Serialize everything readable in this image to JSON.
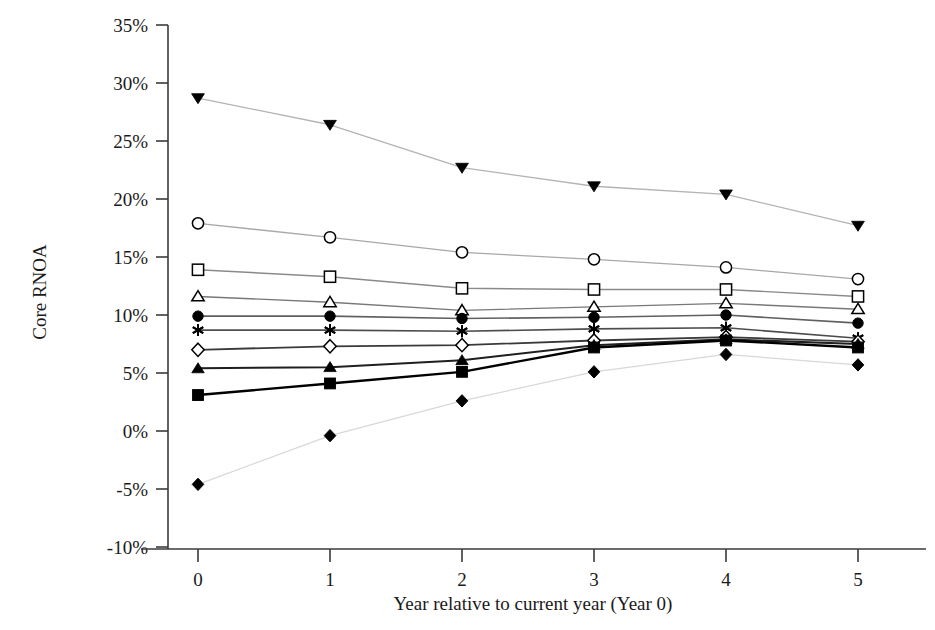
{
  "figure": {
    "clipped_header_text": "",
    "background_color": "#ffffff"
  },
  "chart_data": {
    "type": "line",
    "title": "",
    "xlabel": "Year relative to current year (Year 0)",
    "ylabel": "Core RNOA",
    "x": [
      0,
      1,
      2,
      3,
      4,
      5
    ],
    "xtick_labels": [
      "0",
      "1",
      "2",
      "3",
      "4",
      "5"
    ],
    "ytick_labels": [
      "-10%",
      "-5%",
      "0%",
      "5%",
      "10%",
      "15%",
      "20%",
      "25%",
      "30%",
      "35%"
    ],
    "ytick_values": [
      -10,
      -5,
      0,
      5,
      10,
      15,
      20,
      25,
      30,
      35
    ],
    "ylim": [
      -10,
      35
    ],
    "xlim": [
      -0.45,
      5.45
    ],
    "grid": false,
    "legend_position": "none",
    "yaxis_unit": "percent",
    "series": [
      {
        "name": "Portfolio 10",
        "marker": "filled-triangle-down",
        "color": "#b3b3b3",
        "marker_color": "#000000",
        "line_width": 1.3,
        "values": [
          28.7,
          26.4,
          22.7,
          21.1,
          20.4,
          17.7
        ]
      },
      {
        "name": "Portfolio 9",
        "marker": "open-circle",
        "color": "#a8a8a8",
        "marker_color": "#000000",
        "line_width": 1.3,
        "values": [
          17.9,
          16.7,
          15.4,
          14.8,
          14.1,
          13.1
        ]
      },
      {
        "name": "Portfolio 8",
        "marker": "open-square",
        "color": "#8a8a8a",
        "marker_color": "#000000",
        "line_width": 1.4,
        "values": [
          13.9,
          13.3,
          12.3,
          12.2,
          12.2,
          11.6
        ]
      },
      {
        "name": "Portfolio 7",
        "marker": "open-triangle-up",
        "color": "#787878",
        "marker_color": "#000000",
        "line_width": 1.4,
        "values": [
          11.6,
          11.1,
          10.4,
          10.7,
          11.0,
          10.5
        ]
      },
      {
        "name": "Portfolio 6",
        "marker": "filled-circle",
        "color": "#606060",
        "marker_color": "#000000",
        "line_width": 1.6,
        "values": [
          9.9,
          9.9,
          9.7,
          9.8,
          10.0,
          9.3
        ]
      },
      {
        "name": "Portfolio 5",
        "marker": "asterisk",
        "color": "#4d4d4d",
        "marker_color": "#000000",
        "line_width": 1.6,
        "values": [
          8.7,
          8.7,
          8.6,
          8.8,
          8.9,
          8.0
        ]
      },
      {
        "name": "Portfolio 4",
        "marker": "open-diamond",
        "color": "#3a3a3a",
        "marker_color": "#000000",
        "line_width": 1.8,
        "values": [
          7.0,
          7.3,
          7.4,
          7.8,
          8.1,
          7.7
        ]
      },
      {
        "name": "Portfolio 3",
        "marker": "filled-triangle-up",
        "color": "#1f1f1f",
        "marker_color": "#000000",
        "line_width": 2.0,
        "values": [
          5.4,
          5.5,
          6.1,
          7.4,
          7.9,
          7.5
        ]
      },
      {
        "name": "Portfolio 2",
        "marker": "filled-square",
        "color": "#000000",
        "marker_color": "#000000",
        "line_width": 2.4,
        "values": [
          3.1,
          4.1,
          5.1,
          7.2,
          7.8,
          7.2
        ]
      },
      {
        "name": "Portfolio 1",
        "marker": "filled-diamond",
        "color": "#d8d8d8",
        "marker_color": "#000000",
        "line_width": 1.2,
        "values": [
          -4.6,
          -0.4,
          2.6,
          5.1,
          6.6,
          5.7
        ]
      }
    ]
  }
}
